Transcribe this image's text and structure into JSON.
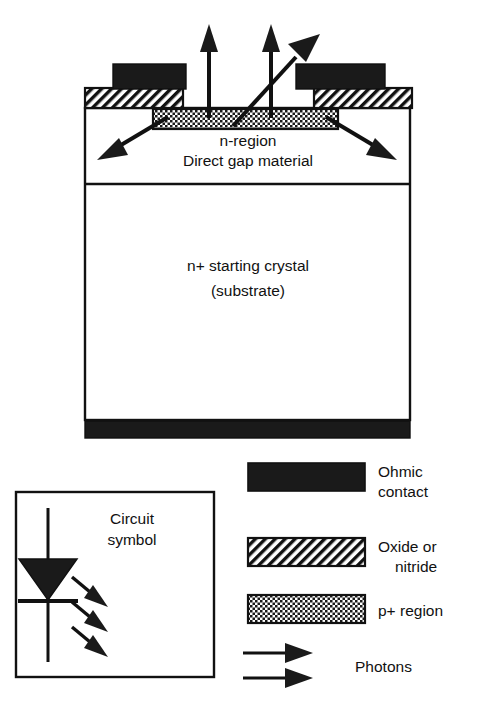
{
  "figure": {
    "device": {
      "region_labels": [
        {
          "text": "n-region",
          "x": 248,
          "y": 146
        },
        {
          "text": "Direct gap material",
          "x": 248,
          "y": 166
        },
        {
          "text": "n+  starting crystal",
          "x": 248,
          "y": 271
        },
        {
          "text": "(substrate)",
          "x": 248,
          "y": 296
        }
      ]
    },
    "legend": {
      "items": [
        {
          "swatch": "ohmic-contact",
          "label_lines": [
            "Ohmic",
            "contact"
          ]
        },
        {
          "swatch": "oxide-nitride",
          "label_lines": [
            "Oxide or",
            "nitride"
          ]
        },
        {
          "swatch": "p-plus-region",
          "label_lines": [
            "p+ region"
          ]
        },
        {
          "swatch": "photon-arrows",
          "label_lines": [
            "Photons"
          ]
        }
      ]
    },
    "circuit": {
      "label_lines": [
        "Circuit",
        "symbol"
      ]
    },
    "colors": {
      "ink": "#111111",
      "contact_fill": "#1a1a1a",
      "background": "#ffffff",
      "hatch_line": "#111111",
      "dot_fill": "#333333"
    }
  }
}
